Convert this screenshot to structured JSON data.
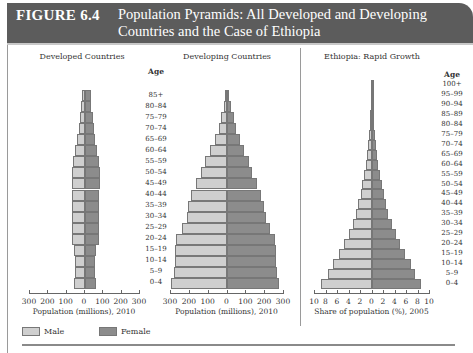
{
  "header": {
    "figure_number": "FIGURE 6.4",
    "title": "Population Pyramids: All Developed and Developing Countries and the Case of Ethiopia"
  },
  "legend": [
    {
      "label": "Male",
      "color": "#cfcfcf"
    },
    {
      "label": "Female",
      "color": "#8c8c8c"
    }
  ],
  "age_heading": "Age",
  "chart_data": [
    {
      "type": "bar",
      "orientation": "horizontal-pyramid",
      "title": "Developed Countries",
      "xlabel": "Population (millions), 2010",
      "ylabel": "Age",
      "xlim": [
        -300,
        300
      ],
      "xticks": [
        "300",
        "200",
        "100",
        "0",
        "100",
        "200",
        "300"
      ],
      "categories": [
        "0–4",
        "5–9",
        "10–14",
        "15–19",
        "20–24",
        "25–29",
        "30–34",
        "35–39",
        "40–44",
        "45–49",
        "50–54",
        "55–59",
        "60–64",
        "65–69",
        "70–74",
        "75–79",
        "80–84",
        "85+"
      ],
      "series": [
        {
          "name": "Male",
          "values": [
            60,
            55,
            55,
            60,
            70,
            70,
            70,
            70,
            70,
            70,
            70,
            65,
            55,
            45,
            35,
            30,
            20,
            15
          ]
        },
        {
          "name": "Female",
          "values": [
            60,
            55,
            55,
            60,
            75,
            75,
            75,
            75,
            75,
            80,
            80,
            75,
            65,
            55,
            50,
            45,
            35,
            35
          ]
        }
      ]
    },
    {
      "type": "bar",
      "orientation": "horizontal-pyramid",
      "title": "Developing Countries",
      "xlabel": "Population (millions), 2010",
      "ylabel": "Age",
      "xlim": [
        -300,
        300
      ],
      "xticks": [
        "300",
        "200",
        "100",
        "0",
        "100",
        "200",
        "300"
      ],
      "categories": [
        "0–4",
        "5–9",
        "10–14",
        "15–19",
        "20–24",
        "25–29",
        "30–34",
        "35–39",
        "40–44",
        "45–49",
        "50–54",
        "55–59",
        "60–64",
        "65–69",
        "70–74",
        "75–79",
        "80–84",
        "85+"
      ],
      "series": [
        {
          "name": "Male",
          "values": [
            295,
            280,
            275,
            275,
            270,
            240,
            215,
            205,
            190,
            165,
            140,
            115,
            90,
            65,
            45,
            30,
            15,
            8
          ]
        },
        {
          "name": "Female",
          "values": [
            275,
            265,
            260,
            260,
            255,
            230,
            205,
            195,
            180,
            160,
            135,
            115,
            90,
            70,
            50,
            35,
            20,
            10
          ]
        }
      ]
    },
    {
      "type": "bar",
      "orientation": "horizontal-pyramid",
      "title": "Ethiopia: Rapid Growth",
      "xlabel": "Share of population (%), 2005",
      "ylabel": "Age",
      "xlim": [
        -10,
        10
      ],
      "xticks": [
        "10",
        "8",
        "6",
        "4",
        "2",
        "0",
        "2",
        "4",
        "6",
        "8",
        "10"
      ],
      "categories": [
        "0–4",
        "5–9",
        "10–14",
        "15–19",
        "20–24",
        "25–29",
        "30–34",
        "35–39",
        "40–44",
        "45–49",
        "50–54",
        "55–59",
        "60–64",
        "65–69",
        "70–74",
        "75–79",
        "80–84",
        "85–89",
        "90–94",
        "95–99",
        "100+"
      ],
      "series": [
        {
          "name": "Male",
          "values": [
            8.8,
            7.6,
            6.8,
            5.8,
            4.8,
            4.0,
            3.3,
            2.8,
            2.4,
            2.0,
            1.7,
            1.4,
            1.1,
            0.9,
            0.7,
            0.55,
            0.4,
            0.3,
            0.2,
            0.1,
            0.05
          ]
        },
        {
          "name": "Female",
          "values": [
            8.6,
            7.5,
            6.8,
            5.8,
            4.9,
            4.1,
            3.4,
            2.8,
            2.4,
            2.0,
            1.7,
            1.4,
            1.1,
            0.9,
            0.7,
            0.55,
            0.4,
            0.3,
            0.2,
            0.1,
            0.05
          ]
        }
      ]
    }
  ]
}
